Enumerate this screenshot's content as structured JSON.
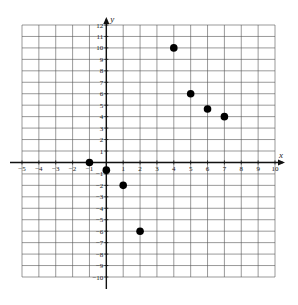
{
  "chart_data": {
    "type": "scatter",
    "title": "",
    "xlabel": "x",
    "ylabel": "y",
    "xlim": [
      -5,
      10
    ],
    "ylim": [
      -10,
      12
    ],
    "grid": true,
    "x_ticks": [
      -5,
      -4,
      -3,
      -2,
      -1,
      1,
      2,
      3,
      4,
      5,
      6,
      7,
      8,
      9,
      10
    ],
    "y_ticks": [
      -10,
      -9,
      -8,
      -7,
      -6,
      -5,
      -4,
      -3,
      -2,
      -1,
      1,
      2,
      3,
      4,
      5,
      6,
      7,
      8,
      9,
      10,
      11,
      12
    ],
    "series": [
      {
        "name": "points",
        "points": [
          {
            "x": -1,
            "y": 0
          },
          {
            "x": 0,
            "y": -0.67
          },
          {
            "x": 1,
            "y": -2
          },
          {
            "x": 2,
            "y": -6
          },
          {
            "x": 4,
            "y": 10
          },
          {
            "x": 5,
            "y": 6
          },
          {
            "x": 6,
            "y": 4.67
          },
          {
            "x": 7,
            "y": 4
          }
        ]
      }
    ]
  },
  "colors": {
    "grid": "#555555",
    "axis": "#111111",
    "point": "#000000"
  }
}
